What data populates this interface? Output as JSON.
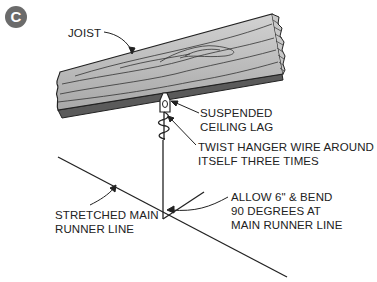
{
  "figure": {
    "badge_letter": "C",
    "badge_color": "#6b6b6b"
  },
  "labels": {
    "joist": "JOIST",
    "suspended_line1": "SUSPENDED",
    "suspended_line2": "CEILING LAG",
    "twist_line1": "TWIST HANGER WIRE AROUND",
    "twist_line2": "ITSELF THREE TIMES",
    "allow_line1": "ALLOW 6\" & BEND",
    "allow_line2": "90 DEGREES AT",
    "allow_line3": "MAIN RUNNER LINE",
    "stretched_line1": "STRETCHED MAIN",
    "stretched_line2": "RUNNER LINE"
  },
  "colors": {
    "wood_face": "#b9b9b9",
    "wood_underside": "#5a5a5a",
    "line": "#222222"
  }
}
